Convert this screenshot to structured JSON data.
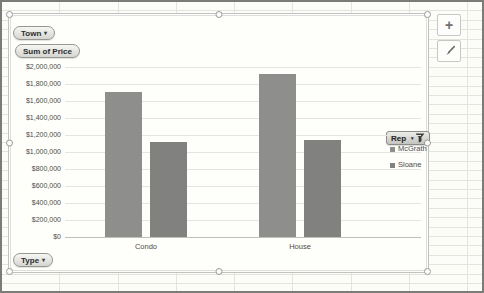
{
  "pivot_buttons": {
    "town": "Town",
    "sum_of_price": "Sum of Price",
    "type": "Type",
    "rep": "Rep",
    "dropdown_glyph": "▾"
  },
  "chart_tools": {
    "elements_glyph": "+",
    "elements_icon": "plus-icon",
    "styles_icon": "paintbrush-icon"
  },
  "chart_data": {
    "type": "bar",
    "title": "",
    "categories": [
      "Condo",
      "House"
    ],
    "series": [
      {
        "name": "McGrath",
        "color": "#8e8e8c",
        "values": [
          1700000,
          1920000
        ]
      },
      {
        "name": "Sloane",
        "color": "#81817f",
        "values": [
          1120000,
          1140000
        ]
      }
    ],
    "ylim": [
      0,
      2000000
    ],
    "ytick_step": 200000,
    "ytick_labels": [
      "$2,000,000",
      "$1,800,000",
      "$1,600,000",
      "$1,400,000",
      "$1,200,000",
      "$1,000,000",
      "$800,000",
      "$600,000",
      "$400,000",
      "$200,000",
      "$0"
    ],
    "grid": true,
    "legend_position": "right",
    "gridline_color": "#e4e4e2",
    "axis_text_color": "#4c4c4a"
  }
}
